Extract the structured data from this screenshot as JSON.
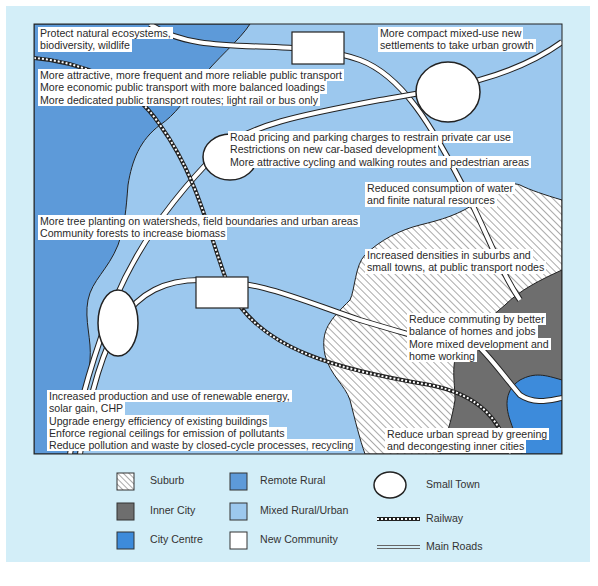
{
  "colors": {
    "background_panel": "#d3eef8",
    "remote_rural": "#5d9ad9",
    "mixed_rural_urban": "#9cc8ee",
    "inner_city": "#6e6e6e",
    "city_centre": "#3d8bdb",
    "new_community": "#ffffff",
    "suburb_hatch": "#444444",
    "outline": "#222222"
  },
  "annotations": [
    {
      "id": "ecosystems",
      "lines": [
        "Protect natural ecosystems,",
        "biodiversity, wildlife"
      ]
    },
    {
      "id": "public-transport",
      "lines": [
        "More attractive, more frequent and more reliable public transport",
        "More economic public transport with more balanced loadings",
        "More dedicated public transport routes; light rail or bus only"
      ]
    },
    {
      "id": "settlements",
      "lines": [
        "More compact mixed-use new",
        "settlements to take urban growth"
      ]
    },
    {
      "id": "road-pricing",
      "lines": [
        "Road pricing and parking charges to restrain private car use",
        "Restrictions on new car-based development",
        "More attractive cycling and walking routes and pedestrian areas"
      ]
    },
    {
      "id": "water",
      "lines": [
        "Reduced consumption of water",
        "and finite natural resources"
      ]
    },
    {
      "id": "trees",
      "lines": [
        "More tree planting on watersheds, field boundaries and urban areas",
        "Community forests to increase biomass"
      ]
    },
    {
      "id": "densities",
      "lines": [
        "Increased densities in suburbs and",
        "small towns, at public transport nodes"
      ]
    },
    {
      "id": "commuting",
      "lines": [
        "Reduce commuting by better",
        "balance of homes and jobs",
        "More mixed development and",
        "home working"
      ]
    },
    {
      "id": "energy",
      "lines": [
        "Increased production and use of renewable energy,",
        "solar gain, CHP",
        "Upgrade energy efficiency of existing buildings",
        "Enforce regional ceilings for emission of pollutants",
        "Reduce pollution and waste by closed-cycle processes, recycling"
      ]
    },
    {
      "id": "urban-spread",
      "lines": [
        "Reduce urban spread by greening",
        "and decongesting inner cities"
      ]
    }
  ],
  "legend": [
    {
      "label": "Suburb",
      "swatch": "hatch"
    },
    {
      "label": "Inner City",
      "swatch": "inner_city"
    },
    {
      "label": "City Centre",
      "swatch": "city_centre"
    },
    {
      "label": "Remote Rural",
      "swatch": "remote_rural"
    },
    {
      "label": "Mixed Rural/Urban",
      "swatch": "mixed_rural_urban"
    },
    {
      "label": "New Community",
      "swatch": "new_community"
    },
    {
      "label": "Small Town",
      "swatch": "circle"
    },
    {
      "label": "Railway",
      "swatch": "railway"
    },
    {
      "label": "Main Roads",
      "swatch": "roads"
    }
  ]
}
